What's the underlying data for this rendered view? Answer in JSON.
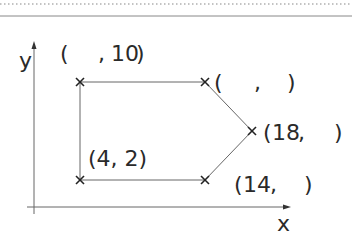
{
  "diagram": {
    "axes": {
      "x_label": "x",
      "y_label": "y"
    },
    "points": [
      {
        "name": "top-left",
        "label_open": "(",
        "label_x": "",
        "label_comma": ",",
        "label_y": "10",
        "label_close": ")"
      },
      {
        "name": "top-right",
        "label_open": "(",
        "label_x": "",
        "label_comma": ",",
        "label_y": "",
        "label_close": ")"
      },
      {
        "name": "right",
        "label_open": "(",
        "label_x": "18",
        "label_comma": ",",
        "label_y": "",
        "label_close": ")"
      },
      {
        "name": "bottom-right",
        "label_open": "(",
        "label_x": "14",
        "label_comma": ",",
        "label_y": "",
        "label_close": ")"
      },
      {
        "name": "bottom-left",
        "label_text": "(4, 2)"
      }
    ],
    "colors": {
      "line": "#555555",
      "text": "#2a2a2a",
      "dotted": "#777777"
    }
  }
}
